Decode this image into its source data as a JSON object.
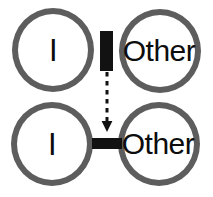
{
  "figure": {
    "width": 213,
    "height": 197,
    "background_color": "#ffffff",
    "type": "concept-diagram"
  },
  "nodes": {
    "top_left": {
      "label": "I",
      "stroke_color": "#5d5d5d",
      "fill_color": "#ffffff",
      "text_color": "#0d0d0d"
    },
    "top_right": {
      "label": "Other",
      "stroke_color": "#5d5d5d",
      "fill_color": "#ffffff",
      "text_color": "#0d0d0d"
    },
    "bottom_left": {
      "label": "I",
      "stroke_color": "#5d5d5d",
      "fill_color": "#ffffff",
      "text_color": "#0d0d0d"
    },
    "bottom_right": {
      "label": "Other",
      "stroke_color": "#5d5d5d",
      "fill_color": "#ffffff",
      "text_color": "#0d0d0d"
    }
  },
  "connectors": {
    "vertical_barrier": {
      "icon": "vertical-bar-icon",
      "orientation": "vertical",
      "color": "#121212"
    },
    "horizontal_link": {
      "icon": "horizontal-bar-icon",
      "orientation": "horizontal",
      "color": "#121212"
    },
    "transition_arrow": {
      "icon": "dashed-down-arrow-icon",
      "direction": "down",
      "style": "dashed",
      "color": "#121212"
    }
  }
}
